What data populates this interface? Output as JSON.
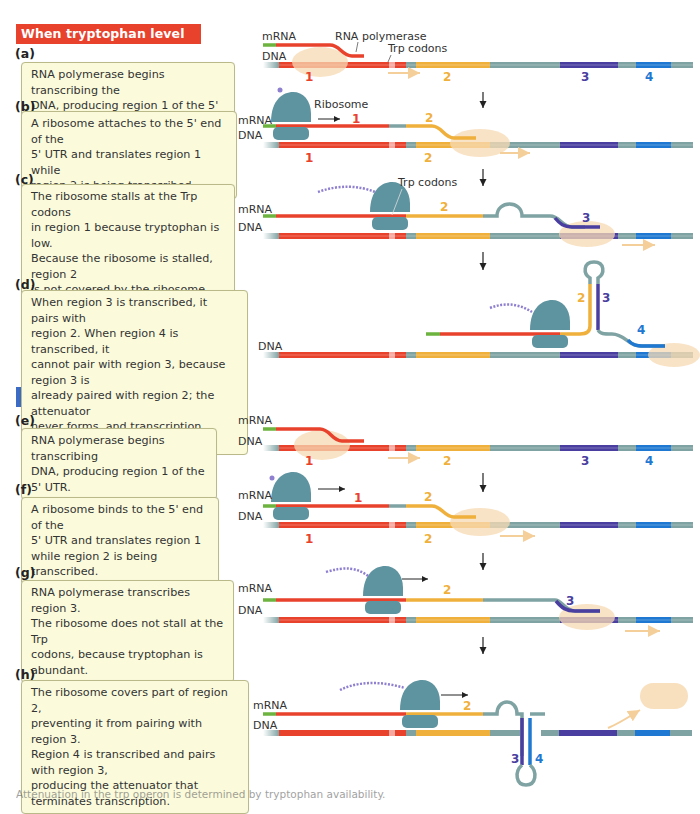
{
  "colors": {
    "region1": "#e8412c",
    "region2": "#f0b03c",
    "region3": "#4a3fa0",
    "region4": "#1f78d1",
    "spacer": "#7fa3a3",
    "leader": "#6cb33f",
    "ribosome": "#5e93a0",
    "polymerase": "#f7d9b3",
    "peptide": "#8f7fd0",
    "low_header": "#e8412c",
    "high_header": "#3b6bc4",
    "box_fill": "#fbfbdc"
  },
  "sections": {
    "low": {
      "title": "When tryptophan level is low"
    },
    "high": {
      "title": "When tryptophan level is high"
    }
  },
  "steps": [
    {
      "letter": "(a)",
      "text": "RNA polymerase begins transcribing the\nDNA, producing region 1 of the 5' UTR."
    },
    {
      "letter": "(b)",
      "text": "A ribosome attaches to the 5' end of the\n5' UTR and translates region 1 while\nregion 2 is being transcribed."
    },
    {
      "letter": "(c)",
      "text": "The ribosome stalls at the Trp codons\nin region 1 because tryptophan is low.\nBecause the ribosome is stalled, region 2\nis not covered by the ribosome when\nregion 3 is transcribed."
    },
    {
      "letter": "(d)",
      "text": "When region 3 is transcribed, it pairs with\nregion 2. When region 4 is transcribed, it\ncannot pair with region 3, because region 3 is\nalready paired with region 2;  the attenuator\nnever forms, and transcription continues."
    },
    {
      "letter": "(e)",
      "text": "RNA polymerase begins transcribing\nDNA, producing region 1 of the 5' UTR."
    },
    {
      "letter": "(f)",
      "text": "A ribosome binds to the 5' end of the\n5' UTR and translates region 1\nwhile region 2 is being transcribed."
    },
    {
      "letter": "(g)",
      "text": "RNA polymerase transcribes region 3.\nThe ribosome does not stall at the Trp\ncodons, because tryptophan is abundant."
    },
    {
      "letter": "(h)",
      "text": "The ribosome covers part of region 2,\npreventing it from pairing with region 3.\nRegion 4 is transcribed and pairs with region 3,\nproducing the attenuator that\nterminates transcription."
    }
  ],
  "labels": {
    "mrna": "mRNA",
    "dna": "DNA",
    "rna_polymerase": "RNA polymerase",
    "trp_codons": "Trp codons",
    "ribosome": "Ribosome",
    "region_1": "1",
    "region_2": "2",
    "region_3": "3",
    "region_4": "4"
  },
  "caption": "Attenuation in the trp operon is determined by tryptophan availability."
}
